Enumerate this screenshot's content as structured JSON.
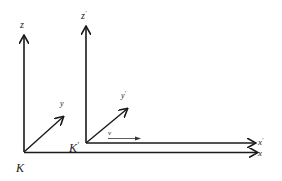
{
  "diagram": {
    "title": "",
    "frames": [
      {
        "name": "K",
        "label": "K",
        "axes": {
          "x": "x",
          "y": "y",
          "z": "z"
        }
      },
      {
        "name": "K'",
        "label": "K",
        "prime": "'",
        "axes": {
          "x": "x",
          "y": "y",
          "z": "z",
          "prime": "'"
        }
      }
    ],
    "velocity_label": "v",
    "colors": {
      "stroke": "#1a1a1a",
      "velocity": "#333333",
      "background": "#ffffff"
    }
  }
}
